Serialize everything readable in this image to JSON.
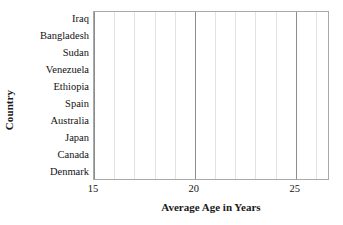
{
  "chart_data": {
    "type": "bar",
    "orientation": "horizontal",
    "title": "",
    "xlabel": "Average Age in Years",
    "ylabel": "Country",
    "categories": [
      "Iraq",
      "Bangladesh",
      "Sudan",
      "Venezuela",
      "Ethiopia",
      "Spain",
      "Australia",
      "Japan",
      "Canada",
      "Denmark"
    ],
    "values": [
      null,
      null,
      null,
      null,
      null,
      null,
      null,
      null,
      null,
      null
    ],
    "series": [
      {
        "name": "Average Age in Years",
        "values": [
          null,
          null,
          null,
          null,
          null,
          null,
          null,
          null,
          null,
          null
        ]
      }
    ],
    "xlim": [
      15,
      26.7
    ],
    "xticks": [
      15,
      20,
      25
    ],
    "xtick_labels": [
      "15",
      "20",
      "25"
    ],
    "x_minor_ticks": [
      16,
      17,
      18,
      19,
      21,
      22,
      23,
      24,
      26
    ],
    "grid": {
      "vertical": true,
      "horizontal": false,
      "minor_vertical": true
    },
    "legend": null,
    "note": "Empty plot grid: axes, gridlines and category labels drawn, no bars plotted",
    "colors": {
      "frame": "#a9a9a9",
      "major_gridline": "#8d8d8d",
      "minor_gridline": "#e2e2e2",
      "plot_background": "#ffffff",
      "text": "#121212"
    }
  },
  "axes": {
    "y_title": "Country",
    "x_title": "Average Age in Years"
  }
}
